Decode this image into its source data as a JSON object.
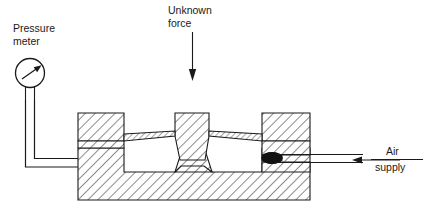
{
  "diagram": {
    "background_color": "#ffffff",
    "line_color": "#1a1a1a",
    "hatch_color": "#1a1a1a",
    "canvas": {
      "width": 426,
      "height": 215
    },
    "labels": {
      "pressure_meter_line1": "Pressure",
      "pressure_meter_line2": "meter",
      "unknown_force_line1": "Unknown",
      "unknown_force_line2": "force",
      "air_supply_line1": "Air",
      "air_supply_line2": "supply"
    },
    "components": {
      "pressure_meter": {
        "name": "pressure-meter-gauge",
        "shape": "circle-with-needle-and-stem",
        "center_x": 30,
        "center_y": 75,
        "radius": 14,
        "needle_angle_deg": -35
      },
      "unknown_force_arrow": {
        "name": "unknown-force-arrow",
        "direction": "down",
        "x": 192,
        "y_start": 32,
        "y_end": 80
      },
      "air_supply_arrow": {
        "name": "air-supply-arrow",
        "direction": "left",
        "y": 160,
        "x_start": 365,
        "x_end": 352
      },
      "connecting_tube": {
        "name": "pressure-tube",
        "path": "from gauge stem down then right into body chamber"
      },
      "nozzle": {
        "name": "nozzle-flapper-blob",
        "x": 272,
        "y": 158
      },
      "metal_body": {
        "name": "machined-metal-body",
        "hatch_pattern": "45-degree diagonal lines",
        "left": 78,
        "right": 310,
        "top": 113,
        "bottom": 200
      }
    }
  }
}
